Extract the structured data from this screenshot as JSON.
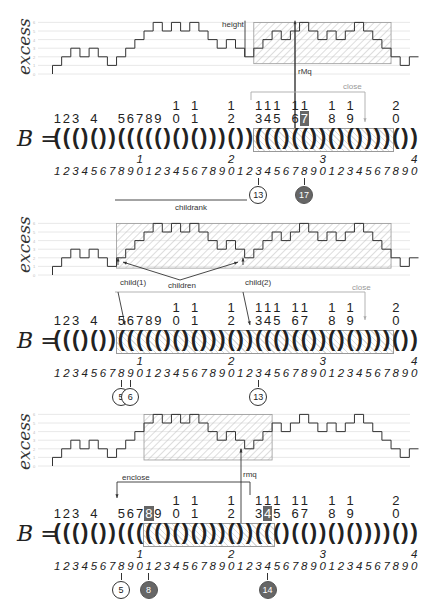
{
  "sequence": {
    "symbol": "B",
    "equals": "=",
    "parens": [
      "(",
      "(",
      "(",
      ")",
      "(",
      ")",
      ")",
      "(",
      "(",
      "(",
      "(",
      "(",
      ")",
      "(",
      ")",
      "(",
      ")",
      ")",
      ")",
      "(",
      ")",
      ")",
      "(",
      "(",
      "(",
      ")",
      "(",
      "(",
      ")",
      ")",
      "(",
      ")",
      "(",
      ")",
      ")",
      ")",
      ")",
      "(",
      ")",
      ")"
    ],
    "open_positions": [
      1,
      2,
      3,
      5,
      8,
      9,
      10,
      11,
      12,
      14,
      16,
      20,
      23,
      24,
      25,
      27,
      28,
      31,
      33,
      38
    ],
    "open_labels_top": [
      "",
      "",
      "",
      "",
      "",
      "",
      "",
      "",
      "",
      "1",
      "1",
      "1",
      "1",
      "1",
      "1",
      "1",
      "1",
      "1",
      "1",
      "2"
    ],
    "open_labels_bottom": [
      "1",
      "2",
      "3",
      "4",
      "5",
      "6",
      "7",
      "8",
      "9",
      "0",
      "1",
      "2",
      "3",
      "4",
      "5",
      "6",
      "7",
      "8",
      "9",
      "0"
    ],
    "index_tens": [
      {
        "pos": 10,
        "label": "1"
      },
      {
        "pos": 20,
        "label": "2"
      },
      {
        "pos": 30,
        "label": "3"
      },
      {
        "pos": 40,
        "label": "4"
      }
    ],
    "index_units": [
      "1",
      "2",
      "3",
      "4",
      "5",
      "6",
      "7",
      "8",
      "9",
      "0",
      "1",
      "2",
      "3",
      "4",
      "5",
      "6",
      "7",
      "8",
      "9",
      "0",
      "1",
      "2",
      "3",
      "4",
      "5",
      "6",
      "7",
      "8",
      "9",
      "0",
      "1",
      "2",
      "3",
      "4",
      "5",
      "6",
      "7",
      "8",
      "9",
      "0"
    ]
  },
  "chart_data": {
    "type": "line",
    "title": "",
    "ylabel": "excess",
    "xlabel": "",
    "ylim": [
      0,
      6
    ],
    "y_ticks": [
      "0",
      "1",
      "2",
      "3",
      "4",
      "5",
      "6"
    ],
    "x": [
      0,
      1,
      2,
      3,
      4,
      5,
      6,
      7,
      8,
      9,
      10,
      11,
      12,
      13,
      14,
      15,
      16,
      17,
      18,
      19,
      20,
      21,
      22,
      23,
      24,
      25,
      26,
      27,
      28,
      29,
      30,
      31,
      32,
      33,
      34,
      35,
      36,
      37,
      38,
      39,
      40
    ],
    "series": [
      {
        "name": "excess",
        "values": [
          0,
          1,
          2,
          3,
          2,
          3,
          2,
          1,
          2,
          3,
          4,
          5,
          6,
          5,
          6,
          5,
          6,
          5,
          4,
          3,
          4,
          3,
          2,
          3,
          4,
          5,
          4,
          5,
          6,
          5,
          4,
          5,
          4,
          5,
          6,
          5,
          4,
          3,
          2,
          1,
          2
        ]
      }
    ]
  },
  "panels": [
    {
      "name": "rMq",
      "annotations": {
        "height": "height",
        "rmq": "rMq",
        "close": "close"
      },
      "box_range": [
        23,
        37
      ],
      "highlight_open": 17,
      "circles": [
        {
          "label": "13",
          "pos": 23,
          "filled": false
        },
        {
          "label": "17",
          "pos": 28,
          "filled": true
        }
      ]
    },
    {
      "name": "children",
      "annotations": {
        "childrank": "childrank",
        "children": "children",
        "child1": "child(1)",
        "child2": "child(2)",
        "close": "close"
      },
      "box_range": [
        8,
        37
      ],
      "circles": [
        {
          "label": "5",
          "pos": 8,
          "filled": false
        },
        {
          "label": "6",
          "pos": 9,
          "filled": false
        },
        {
          "label": "13",
          "pos": 23,
          "filled": false
        }
      ]
    },
    {
      "name": "enclose",
      "annotations": {
        "enclose": "enclose",
        "rmq": "rmq"
      },
      "box_range": [
        11,
        24
      ],
      "highlight_opens": [
        8,
        14
      ],
      "circles": [
        {
          "label": "5",
          "pos": 8,
          "filled": false
        },
        {
          "label": "8",
          "pos": 11,
          "filled": true
        },
        {
          "label": "14",
          "pos": 24,
          "filled": true
        }
      ]
    }
  ]
}
